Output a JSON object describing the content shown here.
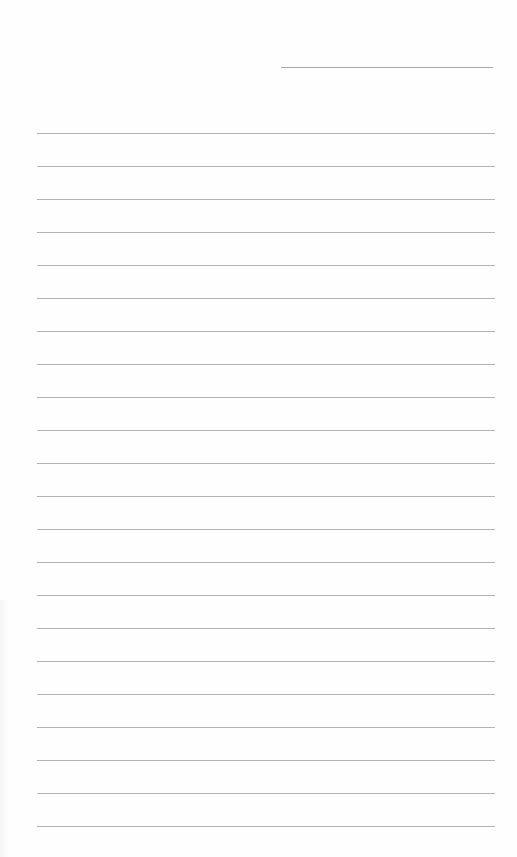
{
  "document": {
    "type": "lined-paper",
    "background_color": "#fefefe",
    "line_color": "#a0a0a0",
    "header_line": {
      "x": 281,
      "y": 67,
      "width": 212
    },
    "rules": {
      "count": 22,
      "start_y": 133,
      "spacing": 33,
      "x": 37,
      "width": 458
    }
  }
}
